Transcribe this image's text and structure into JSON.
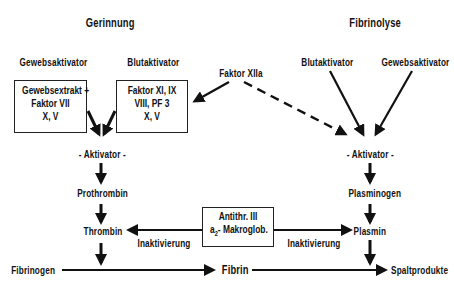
{
  "diagram": {
    "left_title": "Gerinnung",
    "right_title": "Fibrinolyse",
    "left": {
      "gewebsaktivator": "Gewebsaktivator",
      "blutaktivator": "Blutaktivator",
      "box_gewebe": [
        "Gewebsextrakt +",
        "Faktor VII",
        "X, V"
      ],
      "box_blut": [
        "Faktor XI, IX",
        "VIII,  PF 3",
        "X, V"
      ],
      "aktivator": "- Aktivator -",
      "prothrombin": "Prothrombin",
      "thrombin": "Thrombin",
      "inaktivierung": "Inaktivierung",
      "fibrinogen": "Fibrinogen"
    },
    "center": {
      "faktor_xiia": "Faktor XIIa",
      "inhibitor_line1": "Antithr. III",
      "inhibitor_line2_prefix": "a",
      "inhibitor_line2_sub": "2",
      "inhibitor_line2_suffix": "- Makroglob.",
      "fibrin": "Fibrin"
    },
    "right": {
      "blutaktivator": "Blutaktivator",
      "gewebsaktivator": "Gewebsaktivator",
      "aktivator": "- Aktivator -",
      "plasminogen": "Plasminogen",
      "plasmin": "Plasmin",
      "inaktivierung": "Inaktivierung",
      "spaltprodukte": "Spaltprodukte"
    }
  }
}
